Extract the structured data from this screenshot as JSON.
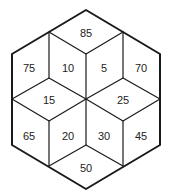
{
  "diagram": {
    "type": "hexagon-of-rhombi",
    "colors": {
      "line": "#1a1a1a",
      "text": "#222222",
      "background": "#ffffff"
    },
    "cells": [
      {
        "id": "top",
        "value": "85",
        "x": 86,
        "y": 33
      },
      {
        "id": "upper-left-outer",
        "value": "75",
        "x": 29,
        "y": 68
      },
      {
        "id": "upper-left-inner",
        "value": "10",
        "x": 68,
        "y": 68
      },
      {
        "id": "upper-right-inner",
        "value": "5",
        "x": 104,
        "y": 68
      },
      {
        "id": "upper-right-outer",
        "value": "70",
        "x": 141,
        "y": 68
      },
      {
        "id": "mid-left",
        "value": "15",
        "x": 49,
        "y": 100
      },
      {
        "id": "mid-right",
        "value": "25",
        "x": 123,
        "y": 100
      },
      {
        "id": "lower-left-outer",
        "value": "65",
        "x": 29,
        "y": 136
      },
      {
        "id": "lower-left-inner",
        "value": "20",
        "x": 68,
        "y": 136
      },
      {
        "id": "lower-right-inner",
        "value": "30",
        "x": 104,
        "y": 136
      },
      {
        "id": "lower-right-outer",
        "value": "45",
        "x": 141,
        "y": 136
      },
      {
        "id": "bottom",
        "value": "50",
        "x": 86,
        "y": 168
      }
    ]
  }
}
